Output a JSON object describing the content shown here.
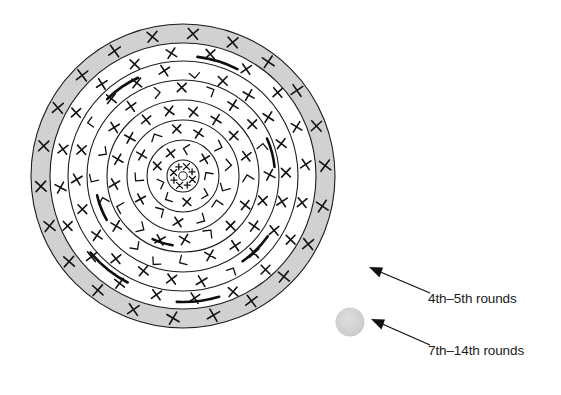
{
  "figure": {
    "background_color": "#ffffff"
  },
  "mandala": {
    "center_x": 183,
    "center_y": 176,
    "outer_band": {
      "name": "outer-shaded-band",
      "outer_radius": 152,
      "inner_radius": 133,
      "fill_color": "#cfcfcf",
      "stroke_color": "#1d1d1d"
    },
    "rings": [
      {
        "radius": 133,
        "label": "ring-1"
      },
      {
        "radius": 115,
        "label": "ring-2"
      },
      {
        "radius": 96,
        "label": "ring-3"
      },
      {
        "radius": 76,
        "label": "ring-4"
      },
      {
        "radius": 56,
        "label": "ring-5"
      },
      {
        "radius": 36,
        "label": "ring-6"
      },
      {
        "radius": 16,
        "label": "center-circle"
      }
    ],
    "center_hub_radius": 4,
    "marks_description": "X-shaped and angular stroke marks distributed around each ring"
  },
  "legend": {
    "items": [
      {
        "id": "legend-4th-5th",
        "label": "4th–5th rounds",
        "marker": "arrow-only",
        "text_x": 428,
        "text_y": 303,
        "arrow_tail_x": 430,
        "arrow_tail_y": 293,
        "arrow_tip_x": 370,
        "arrow_tip_y": 268
      },
      {
        "id": "legend-7th-14th",
        "label": "7th–14th rounds",
        "marker": "gray-dot",
        "marker_color": "#d2d2d2",
        "marker_cx": 350,
        "marker_cy": 322,
        "marker_r": 14,
        "text_x": 428,
        "text_y": 355,
        "arrow_tail_x": 430,
        "arrow_tail_y": 345,
        "arrow_tip_x": 372,
        "arrow_tip_y": 320
      }
    ]
  }
}
